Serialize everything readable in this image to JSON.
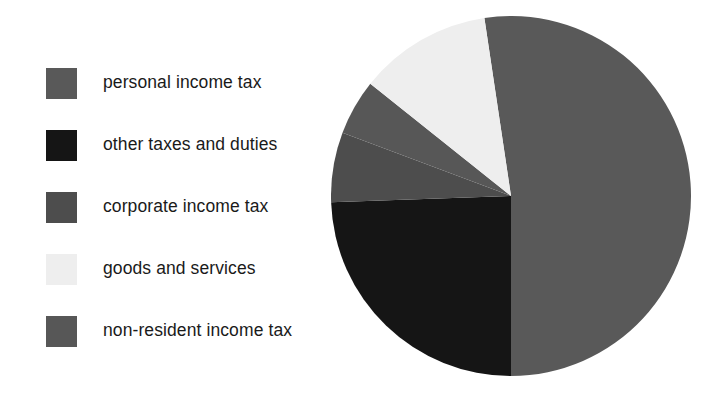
{
  "chart_data": {
    "type": "pie",
    "title": "",
    "subtitle": "",
    "xlabel": "",
    "ylabel": "",
    "grid": false,
    "legend_position": "left",
    "start_angle_deg": -8.5,
    "direction": "clockwise",
    "categories": [
      "personal income tax",
      "other taxes and duties",
      "corporate income tax",
      "goods and services",
      "non-resident income tax"
    ],
    "values": [
      52.4,
      24.4,
      6.3,
      11.9,
      5.0
    ],
    "value_unit": "percent",
    "slices": [
      {
        "label": "personal income tax",
        "value": 52.4,
        "angle_deg": 188.5,
        "color": "#595959",
        "start_deg": -8.5,
        "end_deg": 180.0
      },
      {
        "label": "other taxes and duties",
        "value": 24.4,
        "angle_deg": 88.0,
        "color": "#151515",
        "start_deg": 180.0,
        "end_deg": 268.0
      },
      {
        "label": "corporate income tax",
        "value": 6.3,
        "angle_deg": 22.6,
        "color": "#4d4d4d",
        "start_deg": 268.0,
        "end_deg": 290.6
      },
      {
        "label": "non-resident income tax",
        "value": 5.0,
        "angle_deg": 18.0,
        "color": "#575757",
        "start_deg": 290.6,
        "end_deg": 308.6
      },
      {
        "label": "goods and services",
        "value": 11.9,
        "angle_deg": 43.0,
        "color": "#eeeeee",
        "start_deg": 308.6,
        "end_deg": 351.5
      }
    ]
  },
  "legend": {
    "items": [
      {
        "label": "personal income tax",
        "color": "#595959"
      },
      {
        "label": "other taxes and duties",
        "color": "#151515"
      },
      {
        "label": "corporate income tax",
        "color": "#4d4d4d"
      },
      {
        "label": "goods and services",
        "color": "#eeeeee"
      },
      {
        "label": "non-resident income tax",
        "color": "#575757"
      }
    ]
  },
  "colors": {
    "background": "#ffffff",
    "text": "#1a1a1a",
    "personal_income_tax": "#595959",
    "other_taxes_and_duties": "#151515",
    "corporate_income_tax": "#4d4d4d",
    "goods_and_services": "#eeeeee",
    "non_resident_income_tax": "#575757"
  }
}
